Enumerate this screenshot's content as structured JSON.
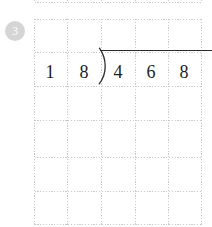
{
  "page": {
    "background_color": "#ffffff",
    "width": 212,
    "height": 227
  },
  "problem": {
    "number": "3",
    "badge_color": "#d5d5d5",
    "badge_text_color": "#ffffff"
  },
  "grid": {
    "line_color": "#c9c9c9",
    "style": "dotted",
    "vertical_lines_x": [
      34,
      67,
      101,
      135,
      168,
      201
    ],
    "horizontal_lines_y": [
      2,
      19,
      52,
      86,
      120,
      157,
      191,
      224
    ],
    "cell_width": 34,
    "cell_height": 34
  },
  "long_division": {
    "divisor_digits": [
      "1",
      "8"
    ],
    "dividend_digits": [
      "4",
      "6",
      "8"
    ],
    "divisor": "18",
    "dividend": "468",
    "bracket_icon": "division-bracket-icon",
    "vinculum_color": "#2a2a2a",
    "digit_color": "#1d1d1d",
    "quotient_digits": []
  }
}
